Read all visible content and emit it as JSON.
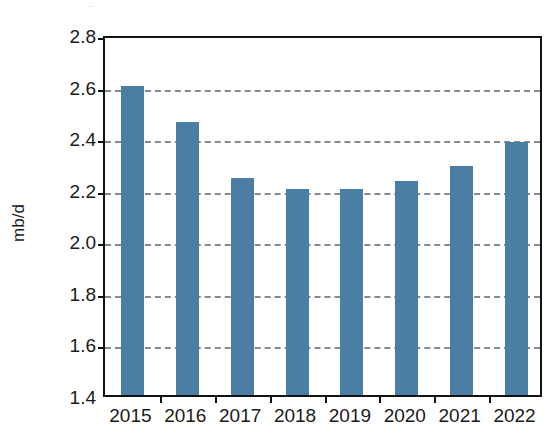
{
  "figure": {
    "title_remnant": "▬                                                    ▪",
    "background_color": "#ffffff"
  },
  "chart_data": {
    "type": "bar",
    "title": "",
    "subtitle": "",
    "xlabel": "",
    "ylabel": "mb/d",
    "categories": [
      "2015",
      "2016",
      "2017",
      "2018",
      "2019",
      "2020",
      "2021",
      "2022"
    ],
    "values": [
      2.6,
      2.46,
      2.24,
      2.2,
      2.2,
      2.23,
      2.29,
      2.38
    ],
    "series": [
      {
        "name": "mb/d",
        "values": [
          2.6,
          2.46,
          2.24,
          2.2,
          2.2,
          2.23,
          2.29,
          2.38
        ],
        "color": "#4a7ea5"
      }
    ],
    "ylim": [
      1.4,
      2.8
    ],
    "ytick_step": 0.2,
    "yticks": [
      1.4,
      1.6,
      1.8,
      2.0,
      2.2,
      2.4,
      2.6,
      2.8
    ],
    "ytick_labels": [
      "1.4",
      "1.6",
      "1.8",
      "2.0",
      "2.2",
      "2.4",
      "2.6",
      "2.8"
    ],
    "gridlines": {
      "horizontal": true,
      "vertical": false,
      "style": "dashed",
      "color": "#8a8a8a",
      "at_values": [
        1.6,
        1.8,
        2.0,
        2.2,
        2.4,
        2.6
      ]
    },
    "legend": {
      "visible": false,
      "position": "none",
      "entries": []
    },
    "annotations": [],
    "axis_frame_color": "#111111",
    "bar_color": "#4a7ea5"
  }
}
